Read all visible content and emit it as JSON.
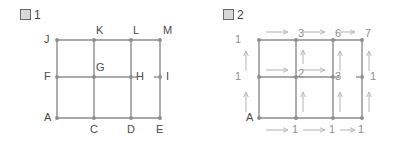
{
  "page": {
    "background_color": "#ffffff",
    "edge_color": "#8c8c8c",
    "node_color": "#8c8c8c",
    "arrow_color": "#b9b9b9",
    "label_color": "#4a4a4a",
    "number_color": "#8e8e8e"
  },
  "figure1": {
    "title_glyph": "図",
    "title_number": "1",
    "title_text": "図1",
    "vertices": [
      {
        "id": "A",
        "label": "A",
        "col": 0,
        "row": 0
      },
      {
        "id": "C",
        "label": "C",
        "col": 1,
        "row": 0
      },
      {
        "id": "D",
        "label": "D",
        "col": 2,
        "row": 0
      },
      {
        "id": "E",
        "label": "E",
        "col": 3,
        "row": 0
      },
      {
        "id": "F",
        "label": "F",
        "col": 0,
        "row": 1
      },
      {
        "id": "G",
        "label": "G",
        "col": 1,
        "row": 1
      },
      {
        "id": "H",
        "label": "H",
        "col": 2,
        "row": 1
      },
      {
        "id": "I",
        "label": "I",
        "col": 3,
        "row": 1
      },
      {
        "id": "J",
        "label": "J",
        "col": 0,
        "row": 2
      },
      {
        "id": "K",
        "label": "K",
        "col": 1,
        "row": 2
      },
      {
        "id": "L",
        "label": "L",
        "col": 2,
        "row": 2
      },
      {
        "id": "M",
        "label": "M",
        "col": 3,
        "row": 2
      }
    ],
    "missing_edge": "H-I"
  },
  "figure2": {
    "title_glyph": "図",
    "title_number": "2",
    "title_text": "図2",
    "start_label": "A",
    "counts": [
      {
        "id": "A",
        "label": "A",
        "col": 0,
        "row": 0
      },
      {
        "id": "C",
        "label": "1",
        "col": 1,
        "row": 0
      },
      {
        "id": "D",
        "label": "1",
        "col": 2,
        "row": 0
      },
      {
        "id": "E",
        "label": "1",
        "col": 3,
        "row": 0
      },
      {
        "id": "F",
        "label": "1",
        "col": 0,
        "row": 1
      },
      {
        "id": "G",
        "label": "2",
        "col": 1,
        "row": 1
      },
      {
        "id": "H",
        "label": "3",
        "col": 2,
        "row": 1
      },
      {
        "id": "I",
        "label": "1",
        "col": 3,
        "row": 1
      },
      {
        "id": "J",
        "label": "1",
        "col": 0,
        "row": 2
      },
      {
        "id": "K",
        "label": "3",
        "col": 1,
        "row": 2
      },
      {
        "id": "L",
        "label": "6",
        "col": 2,
        "row": 2
      },
      {
        "id": "M",
        "label": "7",
        "col": 3,
        "row": 2
      }
    ],
    "missing_edge": "H-I"
  }
}
